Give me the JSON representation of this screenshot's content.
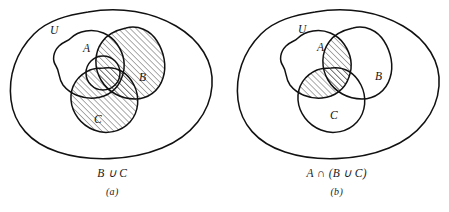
{
  "figure": {
    "background_color": "#ffffff",
    "stroke_color": "#111111",
    "hatch_color": "#3a3a3a",
    "panels": [
      {
        "id": "a",
        "universe_label": "U",
        "set_labels": {
          "a": "A",
          "b": "B",
          "c": "C"
        },
        "caption_expression": "B ∪ C",
        "caption_label": "(a)",
        "shaded_description": "B union C shaded with diagonal hatching"
      },
      {
        "id": "b",
        "universe_label": "U",
        "set_labels": {
          "a": "A",
          "b": "B",
          "c": "C"
        },
        "caption_expression": "A ∩ (B ∪ C)",
        "caption_label": "(b)",
        "shaded_description": "A intersect (B union C) shaded with diagonal hatching"
      }
    ]
  }
}
